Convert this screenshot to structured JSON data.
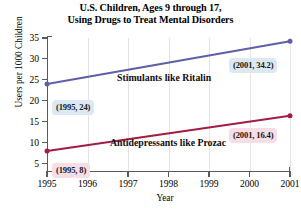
{
  "chart_data": {
    "type": "line",
    "title": "U.S. Children, Ages 9 through 17, Using Drugs to Treat Mental Disorders",
    "title_line1": "U.S. Children, Ages 9 through 17,",
    "title_line2": "Using Drugs to Treat Mental Disorders",
    "xlabel": "Year",
    "ylabel": "Users per 1000 Children",
    "x": [
      1995,
      1996,
      1997,
      1998,
      1999,
      2000,
      2001
    ],
    "xticklabels": [
      "1995",
      "1996",
      "1997",
      "1998",
      "1999",
      "2000",
      "2001"
    ],
    "yticks": [
      5,
      10,
      15,
      20,
      25,
      30,
      35
    ],
    "yticklabels": [
      "5",
      "10",
      "15",
      "20",
      "25",
      "30",
      "35"
    ],
    "xlim": [
      1995,
      2001
    ],
    "ylim": [
      3.2,
      35
    ],
    "grid": "vertical",
    "legend": "inline-labels",
    "series": [
      {
        "name": "Stimulants like Ritalin",
        "color": "#5f5fa8",
        "endpoints": [
          {
            "x": 1995,
            "y": 24
          },
          {
            "x": 2001,
            "y": 34.2
          }
        ],
        "values": [
          24,
          25.7,
          27.4,
          29.1,
          30.8,
          32.5,
          34.2
        ]
      },
      {
        "name": "Antidepressants like Prozac",
        "color": "#a31d42",
        "endpoints": [
          {
            "x": 1995,
            "y": 8
          },
          {
            "x": 2001,
            "y": 16.4
          }
        ],
        "values": [
          8,
          9.4,
          10.8,
          12.2,
          13.6,
          15.0,
          16.4
        ]
      }
    ],
    "annotations": [
      {
        "text": "(2001, 34.2)",
        "style": "blue",
        "series": "Stimulants like Ritalin",
        "x": 2001,
        "y": 34.2
      },
      {
        "text": "(1995, 24)",
        "style": "blue",
        "series": "Stimulants like Ritalin",
        "x": 1995,
        "y": 24
      },
      {
        "text": "(2001, 16.4)",
        "style": "pink",
        "series": "Antidepressants like Prozac",
        "x": 2001,
        "y": 16.4
      },
      {
        "text": "(1995, 8)",
        "style": "pink",
        "series": "Antidepressants like Prozac",
        "x": 1995,
        "y": 8
      }
    ],
    "colors": {
      "stimulants_line": "#5f5fa8",
      "antidepressants_line": "#a31d42",
      "annotation_blue_bg": "#dce8f2",
      "annotation_pink_bg": "#f6dde6",
      "gridline": "#e3e3e8",
      "axis": "#5a5a5a",
      "background": "#ffffff"
    }
  }
}
